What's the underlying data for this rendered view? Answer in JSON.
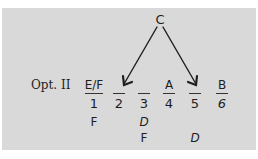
{
  "diagram": {
    "source_letter": "C",
    "option_label": "Opt. II",
    "slots": [
      {
        "position": "1",
        "top": "E/F",
        "below": [
          "F",
          ""
        ]
      },
      {
        "position": "2",
        "top": "",
        "below": [
          "",
          ""
        ]
      },
      {
        "position": "3",
        "top": "",
        "below": [
          "D",
          "F"
        ]
      },
      {
        "position": "4",
        "top": "A",
        "below": [
          "",
          ""
        ]
      },
      {
        "position": "5",
        "top": "",
        "below": [
          "",
          "D"
        ]
      },
      {
        "position": "6",
        "top": "B",
        "below": [
          "",
          ""
        ]
      }
    ],
    "arrows": [
      {
        "from": "C",
        "to": "2"
      },
      {
        "from": "C",
        "to": "5"
      }
    ],
    "colors": {
      "panel": "#d9d9d9",
      "ink": "#1e1e1e"
    }
  }
}
